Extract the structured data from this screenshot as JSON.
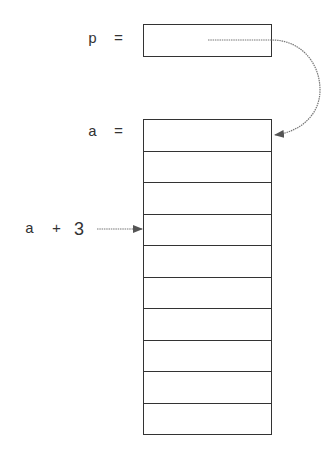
{
  "diagram": {
    "pointer": {
      "name": "p",
      "equals": "="
    },
    "array": {
      "name": "a",
      "equals": "=",
      "cell_count": 10
    },
    "offset_label": {
      "base": "a",
      "op": "+",
      "offset": "3"
    },
    "colors": {
      "stroke": "#333333",
      "arrow": "#666666"
    }
  }
}
